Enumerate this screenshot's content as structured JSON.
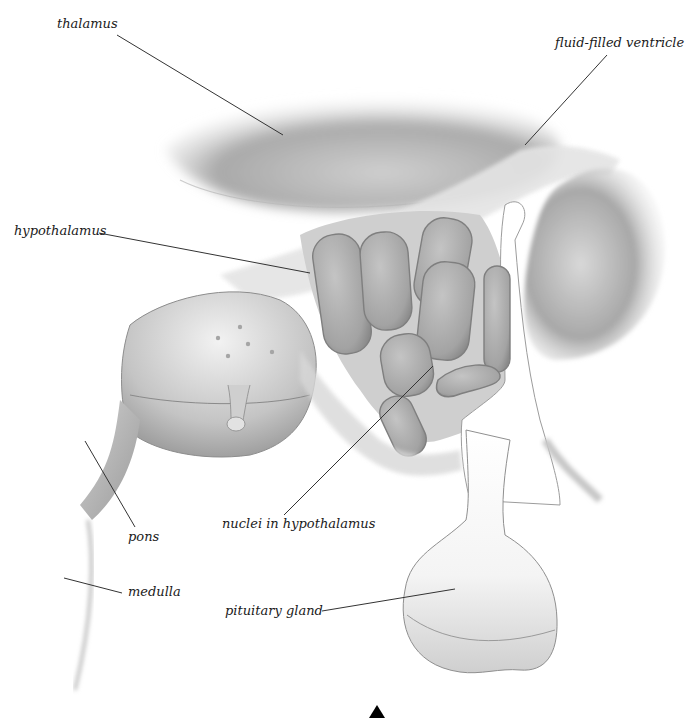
{
  "diagram": {
    "type": "anatomical-illustration",
    "labels": [
      {
        "id": "thalamus",
        "text": "thalamus",
        "x": 57,
        "y": 26
      },
      {
        "id": "fluid-filled-ventricle",
        "text": "fluid-filled ventricle",
        "x": 555,
        "y": 37
      },
      {
        "id": "hypothalamus",
        "text": "hypothalamus",
        "x": 14,
        "y": 226
      },
      {
        "id": "nuclei-in-hypothalamus",
        "text": "nuclei in hypothalamus",
        "x": 222,
        "y": 520
      },
      {
        "id": "pons",
        "text": "pons",
        "x": 128,
        "y": 533
      },
      {
        "id": "medulla",
        "text": "medulla",
        "x": 128,
        "y": 587
      },
      {
        "id": "pituitary-gland",
        "text": "pituitary gland",
        "x": 225,
        "y": 601
      }
    ],
    "leader_lines": [
      {
        "for": "thalamus",
        "x1": 117,
        "y1": 35,
        "x2": 283,
        "y2": 135
      },
      {
        "for": "fluid-filled-ventricle",
        "x1": 607,
        "y1": 55,
        "x2": 525,
        "y2": 145
      },
      {
        "for": "hypothalamus",
        "x1": 99,
        "y1": 233,
        "x2": 310,
        "y2": 273
      },
      {
        "for": "nuclei-in-hypothalamus",
        "x1": 284,
        "y1": 515,
        "x2": 433,
        "y2": 366
      },
      {
        "for": "pons",
        "x1": 85,
        "y1": 441,
        "x2": 135,
        "y2": 527
      },
      {
        "for": "medulla",
        "x1": 64,
        "y1": 578,
        "x2": 122,
        "y2": 593
      },
      {
        "for": "pituitary-gland",
        "x1": 322,
        "y1": 611,
        "x2": 455,
        "y2": 589
      }
    ],
    "marker": {
      "shape": "triangle-up",
      "x": 371,
      "y": 705,
      "color": "#000000"
    }
  }
}
